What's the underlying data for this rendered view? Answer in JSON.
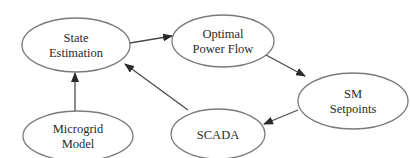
{
  "diagram": {
    "colors": {
      "node_stroke": "#7a7a7a",
      "node_fill": "#ffffff",
      "edge": "#4a4a4a",
      "text": "#2a2a2a"
    },
    "nodes": [
      {
        "id": "state_estimation",
        "lines": [
          "State",
          "Estimation"
        ],
        "cx": 76,
        "cy": 45,
        "rx": 54,
        "ry": 27
      },
      {
        "id": "optimal_power_flow",
        "lines": [
          "Optimal",
          "Power Flow"
        ],
        "cx": 223,
        "cy": 41,
        "rx": 51,
        "ry": 26
      },
      {
        "id": "sm_setpoints",
        "lines": [
          "SM",
          "Setpoints"
        ],
        "cx": 353,
        "cy": 101,
        "rx": 55,
        "ry": 28
      },
      {
        "id": "scada",
        "lines": [
          "SCADA"
        ],
        "cx": 218,
        "cy": 134,
        "rx": 47,
        "ry": 25
      },
      {
        "id": "microgrid_model",
        "lines": [
          "Microgrid",
          "Model"
        ],
        "cx": 78,
        "cy": 136,
        "rx": 55,
        "ry": 25
      }
    ],
    "edges": [
      {
        "from": "state_estimation",
        "to": "optimal_power_flow",
        "x1": 130,
        "y1": 43,
        "x2": 172,
        "y2": 36
      },
      {
        "from": "optimal_power_flow",
        "to": "sm_setpoints",
        "x1": 266,
        "y1": 55,
        "x2": 305,
        "y2": 76
      },
      {
        "from": "sm_setpoints",
        "to": "scada",
        "x1": 298,
        "y1": 110,
        "x2": 264,
        "y2": 124
      },
      {
        "from": "scada",
        "to": "state_estimation",
        "x1": 188,
        "y1": 110,
        "x2": 125,
        "y2": 64
      },
      {
        "from": "microgrid_model",
        "to": "state_estimation",
        "x1": 75,
        "y1": 111,
        "x2": 75,
        "y2": 73
      }
    ]
  }
}
